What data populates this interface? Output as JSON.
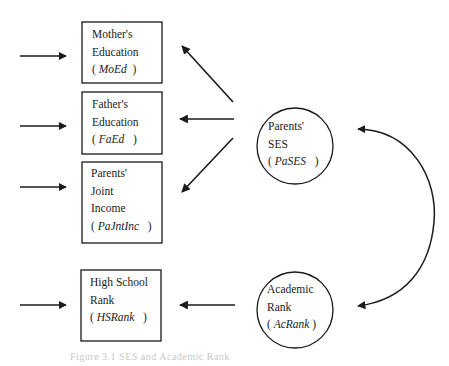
{
  "diagram": {
    "type": "path-model",
    "observed": [
      {
        "id": "moed",
        "line1": "Mother's",
        "line2": "Education",
        "abbr": "MoEd"
      },
      {
        "id": "faed",
        "line1": "Father's",
        "line2": "Education",
        "abbr": "FaEd"
      },
      {
        "id": "pajntinc",
        "line1": "Parents'",
        "line2": "Joint",
        "line3": "Income",
        "abbr": "PaJntInc"
      },
      {
        "id": "hsrank",
        "line1": "High School",
        "line2": "Rank",
        "abbr": "HSRank"
      }
    ],
    "latent": [
      {
        "id": "pases",
        "line1": "Parents'",
        "line2": "SES",
        "abbr": "PaSES"
      },
      {
        "id": "acrank",
        "line1": "Academic",
        "line2": "Rank",
        "abbr": "AcRank"
      }
    ],
    "paths": [
      {
        "from": "pases",
        "to": "moed"
      },
      {
        "from": "pases",
        "to": "faed"
      },
      {
        "from": "pases",
        "to": "pajntinc"
      },
      {
        "from": "acrank",
        "to": "hsrank"
      },
      {
        "from": "pases",
        "to": "acrank",
        "type": "correlation"
      }
    ],
    "error_arrows": [
      "moed",
      "faed",
      "pajntinc",
      "hsrank"
    ],
    "paren_open": "(",
    "paren_close": ")",
    "caption": "Figure 3.1  SES and Academic Rank"
  },
  "colors": {
    "stroke": "#1a1a1a",
    "background": "#ffffff",
    "caption": "#c9c9c9"
  }
}
